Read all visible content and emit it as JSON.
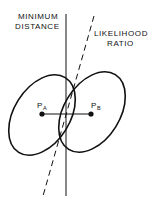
{
  "diagram": {
    "labels": {
      "min_distance_line1": "MINIMUM",
      "min_distance_line2": "DISTANCE",
      "likelihood_line1": "LIKELIHOOD",
      "likelihood_line2": "RATIO",
      "point_a": "P",
      "point_a_sub": "A",
      "point_b": "P",
      "point_b_sub": "B"
    },
    "colors": {
      "ink": "#111111",
      "background": "#ffffff"
    }
  }
}
